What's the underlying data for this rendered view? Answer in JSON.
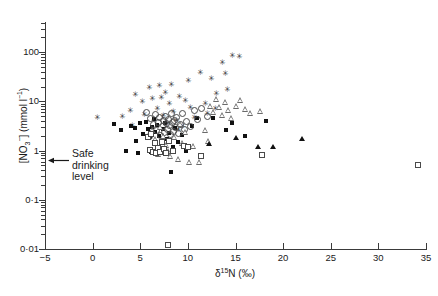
{
  "chart_data": {
    "type": "scatter",
    "title": "",
    "xlabel": "δ 15N (‰)",
    "ylabel": "[NO3-] (mmol l-1)",
    "xlim": [
      -5,
      35
    ],
    "ylim": [
      0.01,
      300
    ],
    "yscale": "log",
    "xscale": "linear",
    "grid": false,
    "legend": "none",
    "xticks": [
      -5,
      0,
      5,
      10,
      15,
      20,
      25,
      30,
      35
    ],
    "xticklabels": [
      "−5",
      "0",
      "5",
      "10",
      "15",
      "20",
      "25",
      "30",
      "35"
    ],
    "yticks": [
      0.01,
      0.1,
      1,
      10,
      100
    ],
    "yticklabels": [
      "0·01",
      "0·1",
      "1",
      "10",
      "100"
    ],
    "annotations": [
      {
        "text": "Safe drinking level",
        "x": -5,
        "y": 0.8,
        "arrow": "left"
      }
    ],
    "series": [
      {
        "name": "star",
        "marker": "star",
        "points": [
          [
            3.1,
            4.9
          ],
          [
            3.9,
            6.3
          ],
          [
            4.4,
            13.5
          ],
          [
            4.1,
            3.2
          ],
          [
            5.2,
            9.5
          ],
          [
            5.4,
            5.3
          ],
          [
            5.9,
            19.0
          ],
          [
            6.2,
            11.0
          ],
          [
            6.4,
            4.2
          ],
          [
            6.8,
            7.0
          ],
          [
            7.0,
            21.0
          ],
          [
            7.2,
            12.0
          ],
          [
            7.4,
            5.0
          ],
          [
            7.6,
            15.0
          ],
          [
            7.8,
            3.4
          ],
          [
            8.0,
            9.0
          ],
          [
            8.2,
            22.0
          ],
          [
            8.4,
            6.0
          ],
          [
            8.8,
            4.0
          ],
          [
            9.1,
            12.5
          ],
          [
            9.4,
            3.0
          ],
          [
            9.7,
            10.0
          ],
          [
            10.0,
            26.0
          ],
          [
            10.2,
            7.5
          ],
          [
            10.6,
            4.6
          ],
          [
            11.3,
            38.0
          ],
          [
            11.8,
            9.0
          ],
          [
            12.0,
            5.5
          ],
          [
            12.4,
            28.0
          ],
          [
            13.0,
            14.0
          ],
          [
            13.6,
            60.0
          ],
          [
            13.9,
            36.0
          ],
          [
            14.1,
            17.0
          ],
          [
            14.6,
            82.0
          ],
          [
            15.4,
            80.0
          ],
          [
            12.9,
            7.0
          ],
          [
            9.0,
            2.6
          ],
          [
            0.5,
            4.7
          ]
        ]
      },
      {
        "name": "filled-square",
        "marker": "filled-square",
        "points": [
          [
            2.2,
            3.4
          ],
          [
            3.0,
            2.6
          ],
          [
            3.5,
            1.0
          ],
          [
            4.0,
            3.2
          ],
          [
            4.4,
            2.9
          ],
          [
            4.6,
            1.6
          ],
          [
            5.0,
            3.6
          ],
          [
            5.3,
            2.2
          ],
          [
            5.6,
            3.9
          ],
          [
            5.8,
            2.7
          ],
          [
            6.0,
            1.9
          ],
          [
            6.2,
            3.0
          ],
          [
            6.4,
            4.4
          ],
          [
            6.6,
            2.4
          ],
          [
            6.8,
            3.3
          ],
          [
            7.0,
            2.0
          ],
          [
            7.2,
            1.4
          ],
          [
            7.4,
            2.8
          ],
          [
            7.6,
            3.6
          ],
          [
            7.8,
            1.7
          ],
          [
            8.0,
            2.3
          ],
          [
            8.2,
            0.36
          ],
          [
            8.4,
            1.2
          ],
          [
            8.6,
            2.9
          ],
          [
            9.0,
            1.5
          ],
          [
            9.4,
            2.1
          ],
          [
            9.8,
            1.0
          ],
          [
            10.4,
            3.1
          ],
          [
            11.0,
            4.7
          ],
          [
            12.6,
            4.5
          ],
          [
            14.0,
            2.6
          ],
          [
            14.6,
            3.7
          ],
          [
            16.0,
            2.0
          ],
          [
            18.2,
            4.0
          ],
          [
            6.1,
            0.95
          ],
          [
            4.8,
            0.9
          ]
        ]
      },
      {
        "name": "open-circle",
        "marker": "open-circle",
        "points": [
          [
            6.0,
            4.6
          ],
          [
            6.3,
            3.4
          ],
          [
            6.5,
            5.5
          ],
          [
            6.7,
            2.6
          ],
          [
            6.9,
            3.9
          ],
          [
            7.0,
            4.9
          ],
          [
            7.1,
            2.1
          ],
          [
            7.3,
            3.1
          ],
          [
            7.4,
            4.2
          ],
          [
            7.5,
            2.4
          ],
          [
            7.6,
            5.1
          ],
          [
            7.7,
            3.6
          ],
          [
            7.8,
            2.8
          ],
          [
            7.9,
            4.4
          ],
          [
            8.0,
            3.3
          ],
          [
            8.1,
            2.2
          ],
          [
            8.2,
            5.8
          ],
          [
            8.3,
            3.8
          ],
          [
            8.4,
            2.5
          ],
          [
            8.5,
            4.1
          ],
          [
            8.6,
            3.0
          ],
          [
            8.8,
            4.8
          ],
          [
            9.0,
            2.3
          ],
          [
            9.2,
            3.5
          ],
          [
            9.4,
            5.9
          ],
          [
            9.6,
            2.7
          ],
          [
            9.8,
            4.0
          ],
          [
            10.2,
            3.2
          ],
          [
            10.6,
            6.8
          ],
          [
            11.0,
            4.3
          ],
          [
            11.4,
            7.2
          ],
          [
            12.0,
            5.0
          ],
          [
            5.6,
            6.0
          ],
          [
            5.9,
            2.0
          ]
        ]
      },
      {
        "name": "open-triangle",
        "marker": "open-triangle",
        "points": [
          [
            6.6,
            1.7
          ],
          [
            7.0,
            1.1
          ],
          [
            7.4,
            2.0
          ],
          [
            7.8,
            1.3
          ],
          [
            8.2,
            0.78
          ],
          [
            8.6,
            1.9
          ],
          [
            9.0,
            0.66
          ],
          [
            9.4,
            1.45
          ],
          [
            9.8,
            2.4
          ],
          [
            10.2,
            0.58
          ],
          [
            10.6,
            1.25
          ],
          [
            11.2,
            0.6
          ],
          [
            11.8,
            2.6
          ],
          [
            12.4,
            8.0
          ],
          [
            12.7,
            6.2
          ],
          [
            13.0,
            11.0
          ],
          [
            13.3,
            7.6
          ],
          [
            13.6,
            5.4
          ],
          [
            14.0,
            9.5
          ],
          [
            14.3,
            6.6
          ],
          [
            14.6,
            4.6
          ],
          [
            15.1,
            8.2
          ],
          [
            15.5,
            10.5
          ],
          [
            16.0,
            7.0
          ],
          [
            16.6,
            5.9
          ],
          [
            17.6,
            6.4
          ],
          [
            6.3,
            2.6
          ],
          [
            7.1,
            3.0
          ],
          [
            6.9,
            0.85
          ],
          [
            8.0,
            1.0
          ],
          [
            9.2,
            3.4
          ],
          [
            12.2,
            1.6
          ]
        ]
      },
      {
        "name": "open-square",
        "marker": "open-square",
        "points": [
          [
            6.0,
            1.05
          ],
          [
            6.3,
            0.92
          ],
          [
            6.5,
            1.4
          ],
          [
            6.7,
            0.88
          ],
          [
            6.9,
            1.15
          ],
          [
            7.1,
            0.95
          ],
          [
            7.3,
            1.5
          ],
          [
            7.5,
            1.1
          ],
          [
            7.7,
            0.9
          ],
          [
            8.0,
            1.6
          ],
          [
            8.4,
            1.0
          ],
          [
            9.6,
            1.25
          ],
          [
            10.0,
            1.2
          ],
          [
            11.4,
            0.78
          ],
          [
            17.8,
            0.8
          ],
          [
            34.2,
            0.52
          ],
          [
            7.9,
            0.012
          ],
          [
            5.8,
            1.9
          ],
          [
            6.1,
            2.2
          ]
        ]
      },
      {
        "name": "filled-triangle",
        "marker": "filled-triangle",
        "points": [
          [
            15.0,
            1.8
          ],
          [
            17.4,
            1.2
          ],
          [
            18.9,
            1.2
          ],
          [
            22.0,
            1.75
          ],
          [
            12.2,
            1.35
          ]
        ]
      }
    ]
  },
  "axes": {
    "x_title_delta": "δ",
    "x_title_sup": "15",
    "x_title_rest": "N (‰)",
    "y_title_a": "[NO",
    "y_title_sub": "3",
    "y_title_sup": "−",
    "y_title_b": "] (mmol l",
    "y_title_sup2": "−1",
    "y_title_c": ")"
  },
  "annotation": {
    "line1": "Safe",
    "line2": "drinking",
    "line3": "level"
  }
}
